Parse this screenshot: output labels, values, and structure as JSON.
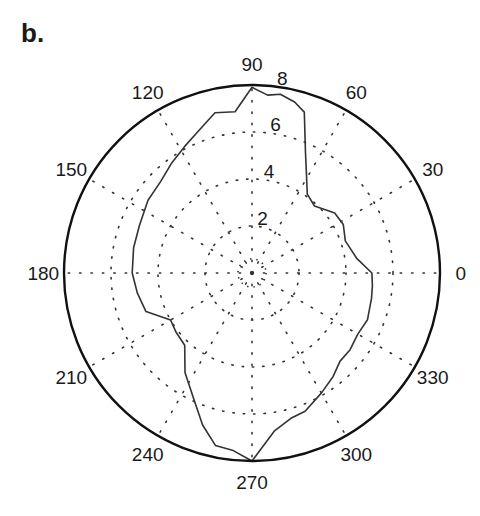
{
  "panel_label": "b.",
  "chart_data": {
    "type": "polar-line",
    "title": "",
    "panel_label": "b.",
    "angle_unit": "degrees",
    "angular_ticks": [
      0,
      30,
      60,
      90,
      120,
      150,
      180,
      210,
      240,
      270,
      300,
      330
    ],
    "radial_ticks": [
      2,
      4,
      6,
      8
    ],
    "rlim": [
      0,
      8
    ],
    "grid": "dotted",
    "legend": null,
    "series": [
      {
        "name": "profile",
        "theta": [
          0,
          8,
          19,
          28,
          36,
          47,
          55,
          66,
          72,
          76,
          81,
          85,
          90,
          96,
          103,
          110,
          118,
          126,
          135,
          145,
          157,
          168,
          180,
          190,
          200,
          210,
          218,
          227,
          236,
          246,
          252,
          258,
          264,
          270,
          278,
          285,
          291,
          300,
          308,
          315,
          322,
          330,
          338,
          348,
          354,
          360
        ],
        "r": [
          5.1,
          4.5,
          4.2,
          4.4,
          4.35,
          3.9,
          4.1,
          5.6,
          7.2,
          7.5,
          7.7,
          7.6,
          7.9,
          6.9,
          7.0,
          6.5,
          6.1,
          5.8,
          5.5,
          5.4,
          5.2,
          5.15,
          5.1,
          4.95,
          4.8,
          4.0,
          4.1,
          4.2,
          5.1,
          6.0,
          6.8,
          7.5,
          7.6,
          8.0,
          6.8,
          6.4,
          6.3,
          5.9,
          5.6,
          5.3,
          5.3,
          5.2,
          5.3,
          5.2,
          5.15,
          5.1
        ]
      }
    ]
  }
}
